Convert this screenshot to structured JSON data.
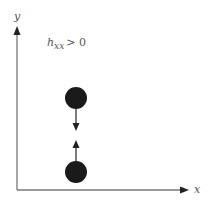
{
  "diagram": {
    "axes": {
      "x_label": "x",
      "y_label": "y",
      "color": "#777777"
    },
    "condition": {
      "base": "h",
      "subscript": "xx",
      "relation": "> 0"
    },
    "particles": [
      {
        "name": "upper-particle",
        "cx": 76,
        "cy": 98,
        "r": 11,
        "color": "#1a1a1a",
        "force": "down"
      },
      {
        "name": "lower-particle",
        "cx": 76,
        "cy": 172,
        "r": 11,
        "color": "#1a1a1a",
        "force": "up"
      }
    ]
  }
}
